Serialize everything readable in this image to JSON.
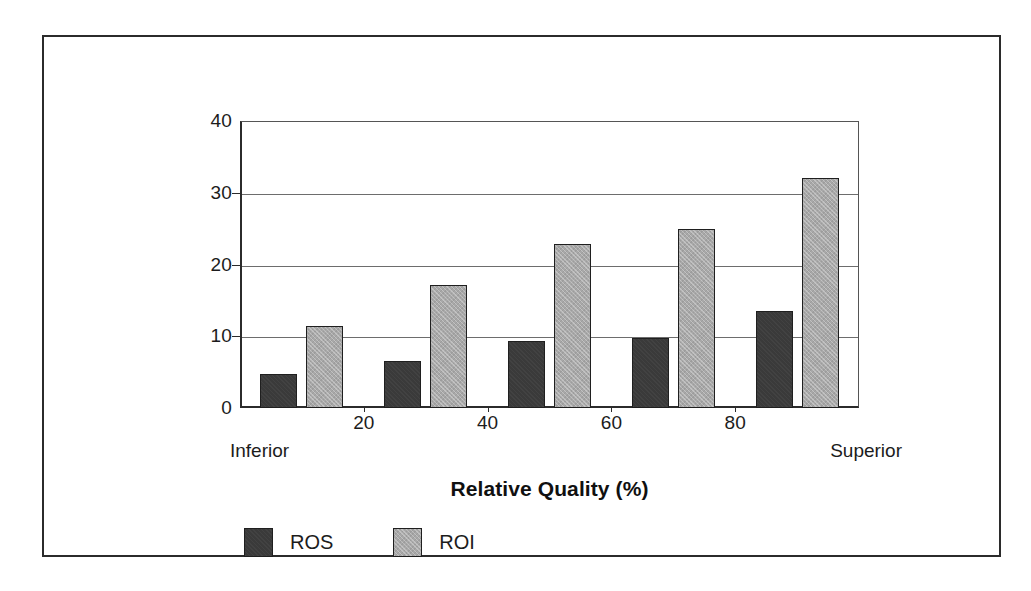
{
  "chart_data": {
    "type": "bar",
    "title": "",
    "subtitle": "",
    "xlabel": "Relative Quality (%)",
    "ylabel": "",
    "ylim": [
      0,
      40
    ],
    "yticks": [
      0,
      10,
      20,
      30,
      40
    ],
    "ytick_labels": [
      "0",
      "10",
      "20",
      "30",
      "40"
    ],
    "xticks": [
      20,
      40,
      60,
      80
    ],
    "xtick_labels": [
      "20",
      "40",
      "60",
      "80"
    ],
    "xlim": [
      0,
      100
    ],
    "grid": "horizontal",
    "legend_position": "below-left",
    "categories": [
      "10",
      "30",
      "50",
      "70",
      "90"
    ],
    "series": [
      {
        "name": "ROS",
        "color": "#3a3a3a",
        "values": [
          4.8,
          6.5,
          9.4,
          9.7,
          13.5
        ]
      },
      {
        "name": "ROI",
        "color": "#a8a8a8",
        "values": [
          11.5,
          17.1,
          22.8,
          25.0,
          32.0
        ]
      }
    ],
    "annotations": {
      "axis_start_label": "Inferior",
      "axis_end_label": "Superior"
    }
  },
  "axis": {
    "x_title": "Relative Quality (%)",
    "y_tick_labels": [
      "40",
      "30",
      "20",
      "10",
      "0"
    ],
    "x_tick_labels": [
      "20",
      "40",
      "60",
      "80"
    ],
    "endpoint_left": "Inferior",
    "endpoint_right": "Superior"
  },
  "legend": {
    "items": [
      {
        "label": "ROS",
        "swatch": "dark-gray-swatch-icon"
      },
      {
        "label": "ROI",
        "swatch": "light-gray-swatch-icon"
      }
    ]
  },
  "colors": {
    "ros": "#3a3a3a",
    "roi": "#a8a8a8",
    "frame": "#2b2b2b",
    "gridline": "#6d6d6d",
    "background": "#ffffff",
    "text": "#1c1c1c"
  }
}
